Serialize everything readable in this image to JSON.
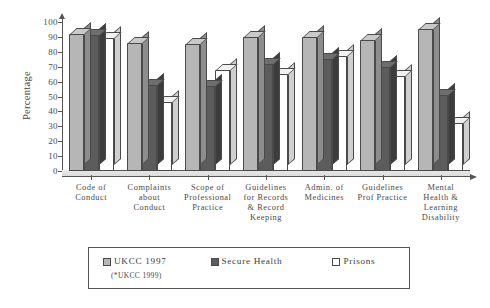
{
  "chart_data": {
    "type": "bar",
    "title": "",
    "xlabel": "",
    "ylabel": "Percentage",
    "ylim": [
      0,
      100
    ],
    "yticks": [
      0,
      10,
      20,
      30,
      40,
      50,
      60,
      70,
      80,
      90,
      100
    ],
    "grid": false,
    "legend_position": "bottom",
    "categories": [
      "Code of Conduct",
      "Complaints about Conduct",
      "Scope of Professional Practice",
      "Guidelines for Records & Record Keeping",
      "Admin. of Medicines",
      "Guidelines Prof Practice",
      "Mental Health & Learning Disability"
    ],
    "category_lines": [
      [
        "Code of",
        "Conduct"
      ],
      [
        "Complaints",
        "about",
        "Conduct"
      ],
      [
        "Scope of",
        "Professional",
        "Practice"
      ],
      [
        "Guidelines",
        "for Records",
        "& Record",
        "Keeping"
      ],
      [
        "Admin. of",
        "Medicines"
      ],
      [
        "Guidelines",
        "Prof Practice"
      ],
      [
        "Mental",
        "Health &",
        "Learning",
        "Disability"
      ]
    ],
    "series": [
      {
        "name": "UKCC 1997",
        "color": "#b6b6b6",
        "values": [
          92,
          86,
          85,
          90,
          90,
          88,
          95
        ]
      },
      {
        "name": "Secure Health",
        "color": "#5c5c5c",
        "values": [
          91,
          58,
          57,
          72,
          75,
          70,
          51
        ]
      },
      {
        "name": "Prisons",
        "color": "#ffffff",
        "values": [
          89,
          46,
          68,
          65,
          77,
          64,
          32
        ]
      }
    ]
  },
  "axis": {
    "y_title": "Percentage",
    "y_tick_labels": [
      "100",
      "90",
      "80",
      "70",
      "60",
      "50",
      "40",
      "30",
      "20",
      "10",
      "0"
    ]
  },
  "legend": {
    "items": [
      {
        "label": "UKCC 1997",
        "sublabel": "(*UKCC 1999)",
        "swatch": "light-gray"
      },
      {
        "label": "Secure Health",
        "sublabel": "",
        "swatch": "dark-gray"
      },
      {
        "label": "Prisons",
        "sublabel": "",
        "swatch": "white"
      }
    ]
  }
}
